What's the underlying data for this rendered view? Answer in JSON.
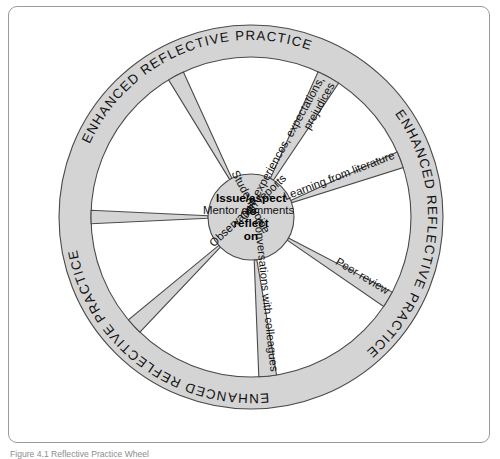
{
  "figure": {
    "caption": "Figure 4.1  Reflective Practice Wheel",
    "frame_border_color": "#9a9a9a",
    "background_color": "#ffffff"
  },
  "wheel": {
    "center_x": 250,
    "center_y": 216,
    "outer_radius": 192,
    "ring_inner_radius": 160,
    "hub_radius": 43,
    "fill_color": "#d4d4d4",
    "stroke_color": "#4a4a4a",
    "hub": {
      "lines": [
        "Issue/aspect",
        "to",
        "reflect",
        "on"
      ]
    },
    "ring_labels": [
      {
        "text": "ENHANCED REFLECTIVE  PRACTICE",
        "start_angle": -156,
        "sweep": 86
      },
      {
        "text": "ENHANCED REFLECTIVE  PRACTICE",
        "start_angle": -36,
        "sweep": 86
      },
      {
        "text": "ENHANCED REFLECTIVE  PRACTICE",
        "start_angle": 84,
        "sweep": 86
      }
    ],
    "spokes": [
      {
        "name": "own-experiences",
        "label": "Own experiences, expectations,",
        "label2": "prejudices",
        "angle": -61,
        "half_width": 4.2,
        "two_line": true
      },
      {
        "name": "learning-from-literature",
        "label": "Learning from literature",
        "angle": -21,
        "half_width": 3.0,
        "two_line": false
      },
      {
        "name": "peer-review",
        "label": "Peer review",
        "angle": 31,
        "half_width": 3.0,
        "two_line": false
      },
      {
        "name": "conversations",
        "label": "Conversations with colleagues",
        "angle": 84,
        "half_width": 3.2,
        "two_line": false
      },
      {
        "name": "observation-reports",
        "label": "Observation reports",
        "angle": 137,
        "half_width": 3.0,
        "two_line": false
      },
      {
        "name": "mentor-comments",
        "label": "Mentor comments",
        "angle": 180,
        "half_width": 2.4,
        "two_line": false
      },
      {
        "name": "student-voice",
        "label": "Student voice",
        "angle": -118,
        "half_width": 3.0,
        "two_line": false
      }
    ]
  }
}
